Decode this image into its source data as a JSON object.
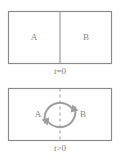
{
  "figure": {
    "panels": [
      {
        "id": "initial-state",
        "time_label_var": "t",
        "time_label_rel": "=0",
        "time_label_full": "t=0",
        "divider_style": "solid",
        "regions": [
          {
            "label": "A",
            "side": "left"
          },
          {
            "label": "B",
            "side": "right"
          }
        ],
        "has_circulation_arrows": false
      },
      {
        "id": "later-state",
        "time_label_var": "t",
        "time_label_rel": ">0",
        "time_label_full": "t>0",
        "divider_style": "dashed",
        "regions": [
          {
            "label": "A",
            "side": "left"
          },
          {
            "label": "B",
            "side": "right"
          }
        ],
        "has_circulation_arrows": true,
        "arrow_description": "two curved arcs forming a clockwise circulation across the divider"
      }
    ],
    "colors": {
      "box_stroke": "#8c8c8c",
      "divider": "#9a9a9a",
      "arrow": "#9e9e9e",
      "text": "#868686",
      "background": "#ffffff"
    },
    "geometry": {
      "box_left": 8,
      "box_right": 112,
      "divider_x": 60,
      "panel1_box_top": 11,
      "panel1_box_bottom": 63,
      "panel2_box_top": 8,
      "panel2_box_bottom": 61
    }
  }
}
